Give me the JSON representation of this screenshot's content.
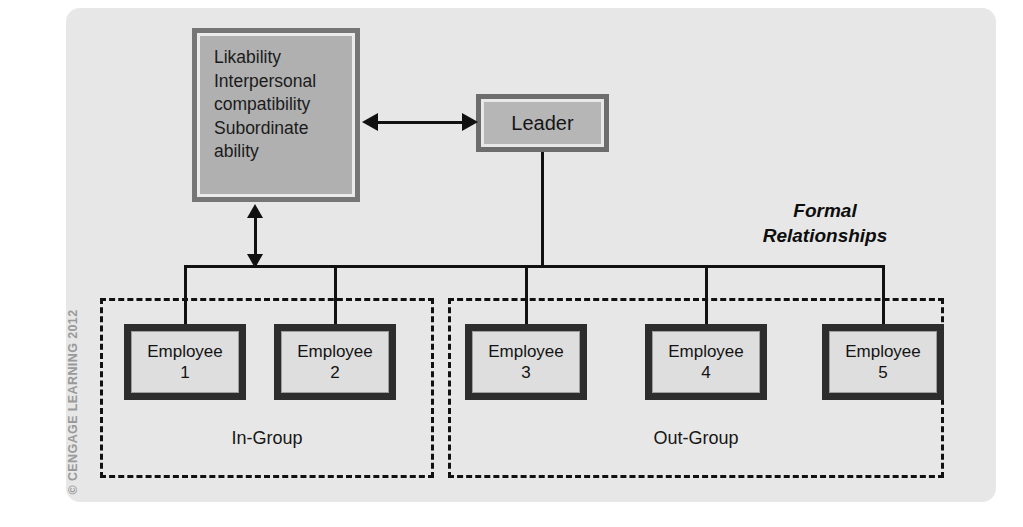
{
  "figure": {
    "credit": "© CENGAGE LEARNING 2012",
    "caption": {
      "line1": "Formal",
      "line2": "Relationships"
    }
  },
  "attributes_box": {
    "lines": [
      "Likability",
      "Interpersonal",
      "compatibility",
      "Subordinate",
      "ability"
    ]
  },
  "leader": {
    "label": "Leader"
  },
  "groups": [
    {
      "id": "in-group",
      "label": "In-Group"
    },
    {
      "id": "out-group",
      "label": "Out-Group"
    }
  ],
  "employees": [
    {
      "name": "Employee",
      "number": "1",
      "group": "in-group"
    },
    {
      "name": "Employee",
      "number": "2",
      "group": "in-group"
    },
    {
      "name": "Employee",
      "number": "3",
      "group": "out-group"
    },
    {
      "name": "Employee",
      "number": "4",
      "group": "out-group"
    },
    {
      "name": "Employee",
      "number": "5",
      "group": "out-group"
    }
  ],
  "colors": {
    "panel_background": "#e7e7e7",
    "box_outer": "#6f6f6f",
    "box_inner": "#b3b3b3",
    "employee_border": "#2d2d2d",
    "employee_fill": "#dedede",
    "line": "#111111",
    "credit_text": "#9a9a9a"
  }
}
